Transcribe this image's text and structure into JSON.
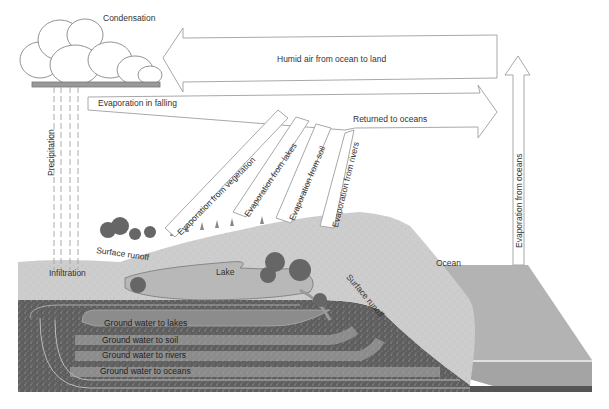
{
  "diagram": {
    "colors": {
      "arrow_stroke": "#a8a8a8",
      "arrow_fill": "#ffffff",
      "land_surface": "#c9c9c9",
      "lake": "#b8b8b8",
      "ground": "#6a6a6a",
      "ocean_top": "#b3b3b3",
      "ocean_side": "#a2a2a2",
      "text": "#333333"
    },
    "labels": {
      "condensation": "Condensation",
      "humid_air": "Humid air from ocean to land",
      "evaporation_in_falling": "Evaporation in falling",
      "returned_to_oceans": "Returned to oceans",
      "evaporation_from_oceans": "Evaporation from oceans",
      "precipitation": "Precipitation",
      "evaporation_from_vegetation": "Evaporation from vegetation",
      "evaporation_from_lakes": "Evaporation from lakes",
      "evaporation_from_soil": "Evaporation from soil",
      "evaporation_from_rivers": "Evaporation from rivers",
      "surface_runoff_left": "Surface runoff",
      "surface_runoff_right": "Surface runoff",
      "infiltration": "Infiltration",
      "lake": "Lake",
      "ocean": "Ocean",
      "ground_water_to_lakes": "Ground water to lakes",
      "ground_water_to_soil": "Ground water to soil",
      "ground_water_to_rivers": "Ground water to rivers",
      "ground_water_to_oceans": "Ground water to oceans"
    }
  }
}
